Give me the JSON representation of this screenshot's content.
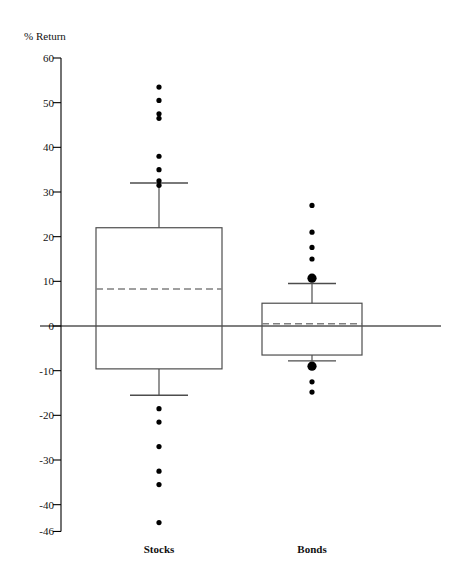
{
  "chart_data": {
    "type": "box",
    "title": "",
    "xlabel": "",
    "ylabel": "% Return",
    "ylim": [
      -46,
      60
    ],
    "yticks": [
      60,
      50,
      40,
      30,
      20,
      10,
      0,
      -10,
      -20,
      -30,
      -40,
      -46
    ],
    "ytick_labels": [
      "60",
      "50",
      "40",
      "30",
      "20",
      "10",
      "0",
      "-10",
      "-20",
      "-30",
      "-40",
      "-46"
    ],
    "grid": false,
    "legend": "none",
    "zero_line": 0,
    "median_style": "dashed",
    "categories": [
      "Stocks",
      "Bonds"
    ],
    "series": [
      {
        "name": "Stocks",
        "whisker_high": 32.0,
        "q3": 22.0,
        "median": 8.3,
        "q1": -9.6,
        "whisker_low": -15.5,
        "outliers_high": [
          53.5,
          50.5,
          47.5,
          46.5,
          38.0,
          35.0,
          32.5,
          31.5
        ],
        "outliers_low": [
          -18.5,
          -21.5,
          -27.0,
          -32.5,
          -35.5,
          -44.0
        ],
        "large_outliers": []
      },
      {
        "name": "Bonds",
        "whisker_high": 9.5,
        "q3": 5.1,
        "median": 0.5,
        "q1": -6.5,
        "whisker_low": -7.8,
        "outliers_high": [
          27.0,
          21.0,
          17.6,
          15.0
        ],
        "outliers_low": [
          -12.5,
          -14.8
        ],
        "large_outliers": [
          10.7,
          -9.0
        ]
      }
    ],
    "colors": {
      "line": "#000000",
      "box": "#4d4d4d",
      "median": "#808080",
      "point": "#000000",
      "axis": "#000000"
    }
  },
  "axis": {
    "title": "% Return"
  },
  "labels": {
    "stocks": "Stocks",
    "bonds": "Bonds"
  }
}
